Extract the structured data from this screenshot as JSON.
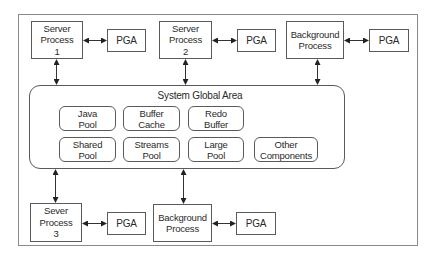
{
  "diagram": {
    "title": "System Global Area",
    "top_row": {
      "server_process_1": "Server\nProcess\n1",
      "pga_1": "PGA",
      "server_process_2": "Server\nProcess\n2",
      "pga_2": "PGA",
      "background_process_1": "Background\nProcess",
      "pga_3": "PGA"
    },
    "sga_components": {
      "java_pool": "Java\nPool",
      "buffer_cache": "Buffer\nCache",
      "redo_buffer": "Redo\nBuffer",
      "shared_pool": "Shared\nPool",
      "streams_pool": "Streams\nPool",
      "large_pool": "Large\nPool",
      "other_components": "Other\nComponents"
    },
    "bottom_row": {
      "server_process_3": "Sever\nProcess\n3",
      "pga_4": "PGA",
      "background_process_2": "Background\nProcess",
      "pga_5": "PGA"
    },
    "edges": [
      {
        "from": "Server Process 1",
        "to": "PGA",
        "type": "bidirectional"
      },
      {
        "from": "Server Process 2",
        "to": "PGA",
        "type": "bidirectional"
      },
      {
        "from": "Background Process",
        "to": "PGA",
        "type": "bidirectional"
      },
      {
        "from": "Sever Process 3",
        "to": "PGA",
        "type": "bidirectional"
      },
      {
        "from": "Background Process",
        "to": "PGA",
        "type": "bidirectional"
      },
      {
        "from": "Server Process 1",
        "to": "System Global Area",
        "type": "bidirectional"
      },
      {
        "from": "Server Process 2",
        "to": "System Global Area",
        "type": "bidirectional"
      },
      {
        "from": "Background Process",
        "to": "System Global Area",
        "type": "bidirectional"
      },
      {
        "from": "Sever Process 3",
        "to": "System Global Area",
        "type": "bidirectional"
      },
      {
        "from": "Background Process",
        "to": "System Global Area",
        "type": "bidirectional"
      }
    ],
    "colors": {
      "stroke": "#5a5a5a",
      "frame": "#8a8a8a",
      "text": "#2a2a2a",
      "background": "#ffffff"
    }
  }
}
